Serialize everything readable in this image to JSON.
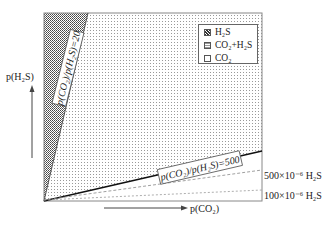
{
  "diagram": {
    "type": "corrosion-regime-diagram",
    "y_axis_label": "p(H2S)",
    "x_axis_label": "p(CO2)",
    "regions": [
      {
        "name": "H2S",
        "label": "H2S",
        "pattern": "dense-dots",
        "color": "#555555"
      },
      {
        "name": "CO2+H2S",
        "label": "CO2+H2S",
        "pattern": "light-dots",
        "color": "#bbbbbb"
      },
      {
        "name": "CO2",
        "label": "CO2",
        "pattern": "none",
        "color": "#ffffff"
      }
    ],
    "boundary_lines": [
      {
        "label": "p(CO2)/p(H2S)=20",
        "ratio": 20
      },
      {
        "label": "p(CO2)/p(H2S)=500",
        "ratio": 500
      }
    ],
    "threshold_lines": [
      {
        "label": "500×10⁻⁶ H2S",
        "style": "dashed"
      },
      {
        "label": "100×10⁻⁶ H2S",
        "style": "dashed"
      }
    ]
  },
  "legend": {
    "items": [
      {
        "label": "H₂S"
      },
      {
        "label": "CO₂+H₂S"
      },
      {
        "label": "CO₂"
      }
    ]
  },
  "labels": {
    "y_axis": "p(H₂S)",
    "x_axis": "p(CO₂)",
    "ratio_20": "p(CO₂)/p(H₂S)=20",
    "ratio_500": "p(CO₂)/p(H₂S)=500",
    "threshold_500": "500×10⁻⁶ H₂S",
    "threshold_100": "100×10⁻⁶ H₂S"
  }
}
